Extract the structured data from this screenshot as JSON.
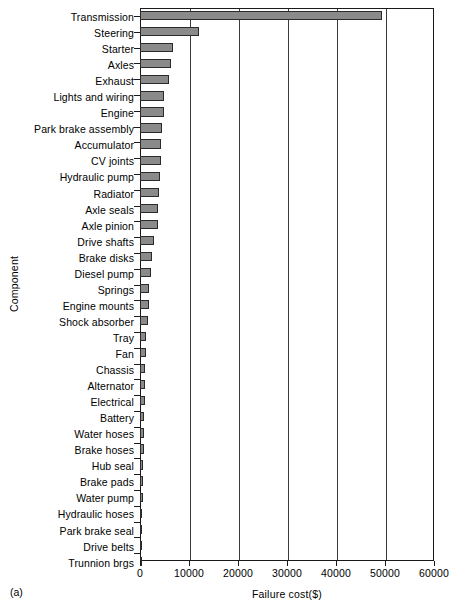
{
  "figure": {
    "panel_caption": "(a)",
    "ylabel": "Component",
    "xlabel": "Failure cost($)"
  },
  "chart_data": {
    "type": "bar",
    "orientation": "horizontal",
    "title": "",
    "xlabel": "Failure cost($)",
    "ylabel": "Component",
    "xlim": [
      0,
      60000
    ],
    "xticks": [
      0,
      10000,
      20000,
      30000,
      40000,
      50000,
      60000
    ],
    "xtick_labels": [
      "0",
      "10000",
      "20000",
      "30000",
      "40000",
      "50000",
      "60000"
    ],
    "grid": "vertical",
    "legend": "none",
    "bar_color": "#8a8a8a",
    "bar_edge_color": "#2b2b2b",
    "categories": [
      "Transmission",
      "Steering",
      "Starter",
      "Axles",
      "Exhaust",
      "Lights and wiring",
      "Engine",
      "Park brake assembly",
      "Accumulator",
      "CV joints",
      "Hydraulic pump",
      "Radiator",
      "Axle seals",
      "Axle pinion",
      "Drive shafts",
      "Brake disks",
      "Diesel pump",
      "Springs",
      "Engine mounts",
      "Shock absorber",
      "Tray",
      "Fan",
      "Chassis",
      "Alternator",
      "Electrical",
      "Battery",
      "Water hoses",
      "Brake hoses",
      "Hub seal",
      "Brake pads",
      "Water pump",
      "Hydraulic hoses",
      "Park brake seal",
      "Drive belts",
      "Trunnion brgs"
    ],
    "values": [
      49300,
      12100,
      6700,
      6300,
      5900,
      4900,
      4900,
      4400,
      4300,
      4200,
      4000,
      3900,
      3700,
      3600,
      2900,
      2500,
      2300,
      1900,
      1800,
      1600,
      1300,
      1200,
      1100,
      1100,
      1000,
      900,
      900,
      800,
      700,
      600,
      600,
      500,
      200,
      150,
      100
    ]
  }
}
